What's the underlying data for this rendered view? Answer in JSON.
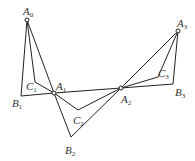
{
  "diagram": {
    "type": "geometry",
    "points": {
      "A0": {
        "x": 27,
        "y": 20,
        "label": "A",
        "sub": "0",
        "lx": 24,
        "ly": 15
      },
      "A1": {
        "x": 54,
        "y": 93,
        "label": "A",
        "sub": "1",
        "lx": 55,
        "ly": 89
      },
      "A2": {
        "x": 121,
        "y": 88,
        "label": "A",
        "sub": "2",
        "lx": 122,
        "ly": 102
      },
      "A3": {
        "x": 178,
        "y": 31,
        "label": "A",
        "sub": "3",
        "lx": 178,
        "ly": 26
      },
      "B1": {
        "x": 21,
        "y": 96,
        "label": "B",
        "sub": "1",
        "lx": 12,
        "ly": 106
      },
      "B2": {
        "x": 71,
        "y": 137,
        "label": "B",
        "sub": "2",
        "lx": 65,
        "ly": 153
      },
      "B3": {
        "x": 173,
        "y": 84,
        "label": "B",
        "sub": "3",
        "lx": 176,
        "ly": 96
      },
      "C1": {
        "x": 35,
        "y": 82,
        "label": "C",
        "sub": "1",
        "lx": 26,
        "ly": 90
      },
      "C2": {
        "x": 78,
        "y": 110,
        "label": "C",
        "sub": "2",
        "lx": 72,
        "ly": 124
      },
      "C3": {
        "x": 158,
        "y": 77,
        "label": "C",
        "sub": "3",
        "lx": 158,
        "ly": 75
      }
    },
    "labels": {
      "A0": "A",
      "A0s": "0",
      "A1": "A",
      "A1s": "1",
      "A2": "A",
      "A2s": "2",
      "A3": "A",
      "A3s": "3",
      "B1": "B",
      "B1s": "1",
      "B2": "B",
      "B2s": "2",
      "B3": "B",
      "B3s": "3",
      "C1": "C",
      "C1s": "1",
      "C2": "C",
      "C2s": "2",
      "C3": "C",
      "C3s": "3"
    },
    "stroke_color": "#222222"
  }
}
